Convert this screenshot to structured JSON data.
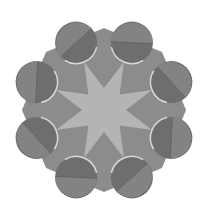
{
  "figure": {
    "width": 202,
    "height": 208,
    "background": "#ffffff",
    "center": [
      104,
      110
    ]
  },
  "octagon": {
    "radius": 82,
    "rotation_deg": -90,
    "fill": "#8c8c8c"
  },
  "star": {
    "points": 8,
    "outer_radius": 52,
    "inner_radius": 22,
    "rotation_deg": -112.5,
    "fill": "#b4b4b4"
  },
  "circles": {
    "count": 8,
    "orbit_radius": 73,
    "radius": 21,
    "start_angle_deg": -112.5,
    "fill_dark": "#6e6e6e",
    "fill_light": "#878787",
    "rim_color": "#d9d9d9",
    "chord_color": "#555555"
  }
}
